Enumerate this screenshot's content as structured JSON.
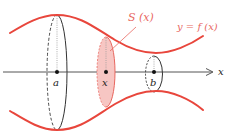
{
  "diagram": {
    "type": "solid-of-revolution",
    "colors": {
      "curve": "#e8463c",
      "cross_section_fill": "#f7c6c3",
      "cross_section_stroke": "#e8675f",
      "label_red": "#e8675f",
      "axis": "#444444",
      "outline": "#333333"
    },
    "labels": {
      "cross_section": "S (x)",
      "function": "y = f (x)",
      "axis": "x",
      "point_a": "a",
      "point_x": "x",
      "point_b": "b"
    }
  }
}
